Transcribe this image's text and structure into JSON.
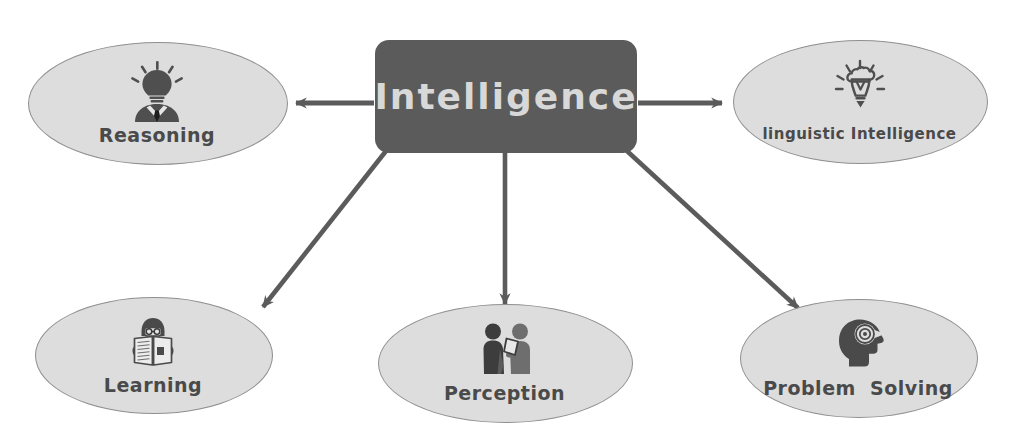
{
  "diagram": {
    "title": "Intelligence",
    "center": {
      "label": "Intelligence",
      "shape": "rounded-rectangle",
      "fill": "#5b5b5b",
      "text_color": "#d8d8d8"
    },
    "node_style": {
      "shape": "ellipse",
      "fill": "#dddddd",
      "border": "#8f8f8f",
      "text_color": "#4a4a4a"
    },
    "edge_style": {
      "color": "#5b5b5b",
      "arrow": "filled-notched"
    },
    "nodes": [
      {
        "id": "reasoning",
        "label": "Reasoning",
        "icon": "lightbulb-head-person-icon",
        "position": "top-left"
      },
      {
        "id": "linguistic",
        "label": "linguistic Intelligence",
        "icon": "lightbulb-outline-icon",
        "position": "top-right"
      },
      {
        "id": "learning",
        "label": "Learning",
        "icon": "person-reading-book-icon",
        "position": "bottom-left"
      },
      {
        "id": "perception",
        "label": "Perception",
        "icon": "two-people-document-icon",
        "position": "bottom-center"
      },
      {
        "id": "problem",
        "label": "Problem  Solving",
        "icon": "head-profile-lightbulb-icon",
        "position": "bottom-right"
      }
    ],
    "edges": [
      {
        "from": "Intelligence",
        "to": "Reasoning"
      },
      {
        "from": "Intelligence",
        "to": "linguistic Intelligence"
      },
      {
        "from": "Intelligence",
        "to": "Learning"
      },
      {
        "from": "Intelligence",
        "to": "Perception"
      },
      {
        "from": "Intelligence",
        "to": "Problem  Solving"
      }
    ]
  }
}
